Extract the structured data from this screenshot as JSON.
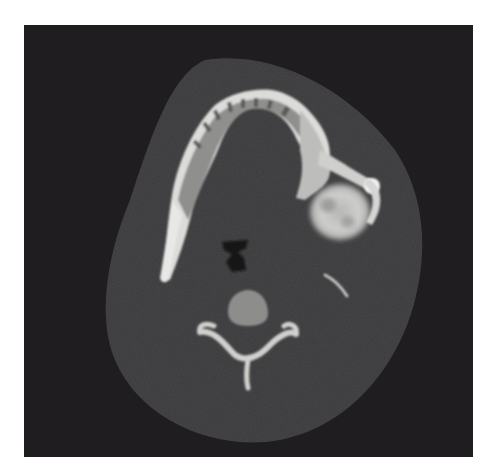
{
  "figure": {
    "kind": "axial CT scan slice",
    "modality": "CT",
    "view": "axial",
    "region": "mandible / upper neck",
    "colors": {
      "page_background": "#ffffff",
      "scan_background": "#1f1d20",
      "soft_tissue": "#3b3a3c",
      "bone": "#e6e6e4",
      "cancellous_bone": "#a9a9a7",
      "lesion": "#c9c9c7",
      "air": "#151416"
    },
    "structures": [
      "mandible-arch",
      "left-mandibular-ramus",
      "expansile-lesion-right-mandible",
      "airway",
      "cervical-vertebral-body",
      "vertebral-posterior-arch",
      "styloid-process"
    ]
  }
}
